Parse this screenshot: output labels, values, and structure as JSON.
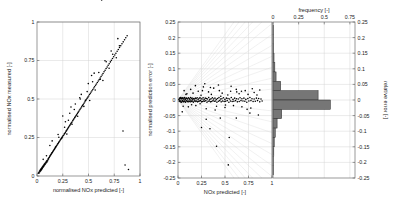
{
  "figure": {
    "title": "",
    "background": "#ffffff",
    "point_color": "#000000",
    "bar_color": "#767676",
    "grid_color": "#d0d0d0"
  },
  "chart_data": [
    {
      "type": "scatter",
      "panel": "left",
      "title": "",
      "xlabel": "normalised NOx predicted [-]",
      "ylabel": "normalised NOx measured [-]",
      "xlim": [
        0,
        1
      ],
      "ylim": [
        0,
        1
      ],
      "xticks": [
        0,
        0.25,
        0.5,
        0.75,
        1
      ],
      "yticks": [
        0,
        0.25,
        0.5,
        0.75,
        1
      ],
      "xticklabels": [
        "0",
        "0.25",
        "0.5",
        "0.75",
        "1"
      ],
      "yticklabels": [
        "0",
        "0.25",
        "0.5",
        "0.75",
        "1"
      ],
      "grid": true,
      "legend": "none",
      "x": [
        0.012,
        0.018,
        0.021,
        0.025,
        0.028,
        0.031,
        0.034,
        0.036,
        0.039,
        0.042,
        0.045,
        0.048,
        0.051,
        0.054,
        0.057,
        0.06,
        0.063,
        0.066,
        0.069,
        0.072,
        0.075,
        0.078,
        0.081,
        0.085,
        0.088,
        0.092,
        0.095,
        0.098,
        0.102,
        0.105,
        0.109,
        0.112,
        0.116,
        0.12,
        0.124,
        0.128,
        0.132,
        0.136,
        0.14,
        0.145,
        0.149,
        0.153,
        0.158,
        0.162,
        0.167,
        0.171,
        0.176,
        0.18,
        0.185,
        0.19,
        0.195,
        0.2,
        0.205,
        0.21,
        0.215,
        0.22,
        0.226,
        0.231,
        0.236,
        0.242,
        0.247,
        0.253,
        0.258,
        0.264,
        0.269,
        0.275,
        0.281,
        0.286,
        0.292,
        0.298,
        0.304,
        0.31,
        0.316,
        0.322,
        0.328,
        0.334,
        0.34,
        0.347,
        0.353,
        0.359,
        0.366,
        0.372,
        0.379,
        0.385,
        0.392,
        0.399,
        0.406,
        0.413,
        0.42,
        0.427,
        0.434,
        0.441,
        0.448,
        0.456,
        0.463,
        0.471,
        0.478,
        0.486,
        0.494,
        0.502,
        0.51,
        0.518,
        0.526,
        0.534,
        0.542,
        0.551,
        0.559,
        0.568,
        0.577,
        0.586,
        0.595,
        0.604,
        0.613,
        0.622,
        0.632,
        0.641,
        0.651,
        0.661,
        0.671,
        0.681,
        0.691,
        0.701,
        0.712,
        0.722,
        0.733,
        0.744,
        0.755,
        0.766,
        0.778,
        0.789,
        0.801,
        0.813,
        0.825,
        0.837,
        0.85,
        0.862,
        0.875,
        0.888,
        0.06,
        0.125,
        0.18,
        0.205,
        0.24,
        0.268,
        0.29,
        0.305,
        0.34,
        0.362,
        0.395,
        0.42,
        0.455,
        0.487,
        0.512,
        0.54,
        0.565,
        0.6,
        0.64,
        0.672,
        0.7,
        0.735,
        0.77,
        0.8,
        0.835,
        0.25,
        0.33,
        0.415,
        0.47,
        0.53,
        0.615,
        0.66,
        0.72,
        0.785,
        0.855,
        0.092,
        0.147,
        0.212,
        0.276,
        0.318,
        0.372,
        0.43,
        0.498,
        0.555,
        0.628
      ],
      "y": [
        0.018,
        0.024,
        0.02,
        0.032,
        0.027,
        0.038,
        0.033,
        0.043,
        0.038,
        0.049,
        0.043,
        0.055,
        0.049,
        0.06,
        0.055,
        0.066,
        0.061,
        0.071,
        0.067,
        0.077,
        0.073,
        0.082,
        0.078,
        0.089,
        0.084,
        0.096,
        0.09,
        0.101,
        0.098,
        0.104,
        0.112,
        0.11,
        0.119,
        0.122,
        0.128,
        0.131,
        0.136,
        0.14,
        0.144,
        0.15,
        0.153,
        0.157,
        0.163,
        0.167,
        0.172,
        0.176,
        0.182,
        0.185,
        0.191,
        0.196,
        0.201,
        0.207,
        0.211,
        0.217,
        0.222,
        0.227,
        0.234,
        0.238,
        0.243,
        0.25,
        0.254,
        0.261,
        0.265,
        0.272,
        0.276,
        0.283,
        0.29,
        0.294,
        0.301,
        0.307,
        0.314,
        0.32,
        0.326,
        0.332,
        0.339,
        0.345,
        0.351,
        0.359,
        0.365,
        0.371,
        0.379,
        0.385,
        0.392,
        0.398,
        0.406,
        0.413,
        0.42,
        0.428,
        0.435,
        0.442,
        0.449,
        0.457,
        0.464,
        0.472,
        0.48,
        0.488,
        0.495,
        0.504,
        0.512,
        0.52,
        0.529,
        0.537,
        0.545,
        0.553,
        0.562,
        0.571,
        0.579,
        0.589,
        0.598,
        0.607,
        0.617,
        0.626,
        0.636,
        0.646,
        0.656,
        0.666,
        0.677,
        0.687,
        0.698,
        0.708,
        0.719,
        0.729,
        0.741,
        0.751,
        0.763,
        0.774,
        0.786,
        0.797,
        0.81,
        0.821,
        0.834,
        0.846,
        0.859,
        0.871,
        0.885,
        0.898,
        0.911,
        0.042,
        0.108,
        0.198,
        0.188,
        0.27,
        0.245,
        0.316,
        0.272,
        0.362,
        0.336,
        0.432,
        0.388,
        0.5,
        0.452,
        0.548,
        0.49,
        0.612,
        0.558,
        0.672,
        0.62,
        0.742,
        0.7,
        0.79,
        0.768,
        0.846,
        0.292,
        0.39,
        0.448,
        0.508,
        0.492,
        0.652,
        0.628,
        0.748,
        0.812,
        0.892,
        0.072,
        0.132,
        0.228,
        0.252,
        0.352,
        0.408,
        0.468,
        0.53,
        0.6,
        0.668
      ],
      "n_points": 190
    },
    {
      "type": "scatter",
      "panel": "middle",
      "title": "",
      "xlabel": "NOx predicted [-]",
      "ylabel": "normalised prediction error [-]",
      "xlim": [
        0,
        1
      ],
      "ylim": [
        -0.25,
        0.25
      ],
      "xticks": [
        0,
        0.25,
        0.5,
        0.75,
        1
      ],
      "yticks": [
        -0.25,
        -0.2,
        -0.15,
        -0.1,
        -0.05,
        0,
        0.05,
        0.1,
        0.15,
        0.2,
        0.25
      ],
      "xticklabels": [
        "0",
        "0.25",
        "0.5",
        "0.75",
        "1"
      ],
      "yticklabels": [
        "-0.25",
        "-0.2",
        "-0.15",
        "-0.1",
        "-0.05",
        "0",
        "0.05",
        "0.1",
        "0.15",
        "0.2",
        "0.25"
      ],
      "grid": true,
      "legend": "none",
      "annotation": "fan of radiating constant-relative-error lines from origin",
      "fan_lines_from": [
        0,
        0
      ],
      "fan_line_count": 24,
      "x": [
        0.01,
        0.014,
        0.017,
        0.02,
        0.023,
        0.026,
        0.029,
        0.032,
        0.035,
        0.038,
        0.041,
        0.044,
        0.047,
        0.05,
        0.053,
        0.056,
        0.059,
        0.062,
        0.065,
        0.068,
        0.071,
        0.074,
        0.077,
        0.08,
        0.084,
        0.087,
        0.09,
        0.094,
        0.097,
        0.101,
        0.104,
        0.108,
        0.111,
        0.115,
        0.119,
        0.122,
        0.126,
        0.13,
        0.134,
        0.138,
        0.142,
        0.146,
        0.15,
        0.154,
        0.158,
        0.163,
        0.167,
        0.171,
        0.176,
        0.18,
        0.185,
        0.19,
        0.194,
        0.199,
        0.204,
        0.209,
        0.214,
        0.219,
        0.224,
        0.229,
        0.234,
        0.24,
        0.245,
        0.25,
        0.256,
        0.261,
        0.267,
        0.273,
        0.278,
        0.284,
        0.29,
        0.296,
        0.302,
        0.308,
        0.314,
        0.32,
        0.327,
        0.333,
        0.339,
        0.346,
        0.352,
        0.359,
        0.366,
        0.372,
        0.379,
        0.386,
        0.393,
        0.4,
        0.407,
        0.414,
        0.422,
        0.429,
        0.436,
        0.444,
        0.452,
        0.459,
        0.467,
        0.475,
        0.483,
        0.491,
        0.499,
        0.507,
        0.515,
        0.524,
        0.532,
        0.541,
        0.549,
        0.558,
        0.567,
        0.576,
        0.585,
        0.594,
        0.603,
        0.612,
        0.622,
        0.631,
        0.641,
        0.651,
        0.66,
        0.67,
        0.68,
        0.691,
        0.701,
        0.711,
        0.722,
        0.732,
        0.743,
        0.754,
        0.765,
        0.776,
        0.787,
        0.799,
        0.81,
        0.822,
        0.834,
        0.846,
        0.858,
        0.87,
        0.883,
        0.895,
        0.03,
        0.045,
        0.065,
        0.085,
        0.11,
        0.135,
        0.16,
        0.19,
        0.215,
        0.245,
        0.27,
        0.3,
        0.325,
        0.355,
        0.38,
        0.41,
        0.44,
        0.47,
        0.5,
        0.53,
        0.56,
        0.59,
        0.62,
        0.65,
        0.68,
        0.715,
        0.745,
        0.775,
        0.81,
        0.84,
        0.87,
        0.055,
        0.095,
        0.145,
        0.185,
        0.235,
        0.285,
        0.345,
        0.395,
        0.455,
        0.505,
        0.565,
        0.625,
        0.675,
        0.735,
        0.79,
        0.855,
        0.26,
        0.3,
        0.34,
        0.43,
        0.545,
        0.62,
        0.41,
        0.535,
        0.765,
        0.25,
        0.45
      ],
      "y": [
        0.002,
        -0.004,
        0.006,
        -0.002,
        0.004,
        -0.006,
        0.008,
        -0.003,
        0.005,
        -0.007,
        0.003,
        -0.004,
        0.006,
        -0.002,
        0.007,
        -0.005,
        0.003,
        -0.006,
        0.004,
        -0.003,
        0.008,
        -0.004,
        0.002,
        -0.007,
        0.005,
        -0.003,
        0.006,
        -0.002,
        0.004,
        -0.005,
        0.003,
        -0.006,
        0.007,
        -0.003,
        0.005,
        -0.004,
        0.002,
        -0.006,
        0.008,
        -0.002,
        0.004,
        -0.005,
        0.006,
        -0.003,
        0.002,
        -0.007,
        0.005,
        -0.004,
        0.003,
        -0.002,
        0.006,
        -0.005,
        0.004,
        -0.003,
        0.007,
        -0.006,
        0.002,
        -0.004,
        0.005,
        -0.003,
        0.008,
        -0.002,
        0.004,
        -0.006,
        0.003,
        -0.005,
        0.007,
        -0.003,
        0.002,
        -0.004,
        0.006,
        -0.002,
        0.005,
        -0.007,
        0.003,
        -0.004,
        0.008,
        -0.003,
        0.002,
        -0.006,
        0.004,
        -0.005,
        0.007,
        -0.002,
        0.003,
        -0.004,
        0.006,
        -0.003,
        0.002,
        -0.007,
        0.005,
        -0.004,
        0.008,
        -0.002,
        0.003,
        -0.006,
        0.004,
        -0.003,
        0.007,
        -0.005,
        0.002,
        -0.004,
        0.006,
        -0.002,
        0.005,
        -0.007,
        0.003,
        -0.003,
        0.008,
        -0.005,
        0.002,
        -0.004,
        0.006,
        -0.002,
        0.004,
        -0.006,
        0.003,
        -0.005,
        0.007,
        -0.002,
        0.004,
        -0.003,
        0.006,
        -0.004,
        0.002,
        -0.007,
        0.005,
        -0.003,
        0.008,
        -0.002,
        0.004,
        -0.005,
        0.003,
        -0.004,
        0.006,
        -0.002,
        0.005,
        -0.006,
        0.003,
        -0.003,
        0.007,
        -0.038,
        0.03,
        0.018,
        -0.022,
        0.034,
        0.022,
        -0.018,
        0.028,
        0.015,
        0.042,
        -0.028,
        0.026,
        0.018,
        0.038,
        -0.02,
        0.03,
        0.022,
        -0.024,
        0.016,
        0.028,
        -0.018,
        0.034,
        0.02,
        -0.022,
        0.03,
        0.018,
        -0.026,
        0.024,
        0.016,
        0.032,
        -0.02,
        0.02,
        -0.015,
        0.046,
        -0.012,
        0.052,
        0.04,
        -0.032,
        0.012,
        -0.016,
        0.044,
        0.026,
        0.028,
        -0.03,
        0.036,
        -0.048,
        0.03,
        -0.062,
        -0.092,
        0.048,
        -0.12,
        -0.058,
        -0.148,
        -0.208,
        -0.042,
        -0.088,
        -0.058,
        0.15
      ],
      "n_points": 200
    },
    {
      "type": "bar",
      "orientation": "horizontal",
      "panel": "right",
      "title": "",
      "xlabel": "frequency [-]",
      "ylabel": "relative error [-]",
      "xlabel_position": "top",
      "ylabel_position": "right",
      "xlim": [
        0,
        0.8
      ],
      "ylim": [
        -0.25,
        0.25
      ],
      "xticks": [
        0,
        0.25,
        0.5,
        0.75
      ],
      "xticklabels": [
        "0",
        "0.25",
        "0.5",
        "0.75"
      ],
      "yticks": [
        -0.25,
        -0.2,
        -0.15,
        -0.1,
        -0.05,
        0,
        0.05,
        0.1,
        0.15,
        0.2,
        0.25
      ],
      "yticklabels": [
        "-0.25",
        "-0.2",
        "-0.15",
        "-0.1",
        "-0.05",
        "0",
        "0.05",
        "0.1",
        "0.15",
        "0.2",
        "0.25"
      ],
      "grid": true,
      "legend": "none",
      "bin_centers": [
        0.225,
        0.195,
        0.165,
        0.135,
        0.105,
        0.075,
        0.045,
        0.015,
        -0.015,
        -0.045,
        -0.075,
        -0.105,
        -0.135,
        -0.165,
        -0.195,
        -0.225
      ],
      "bin_edges": [
        -0.24,
        -0.21,
        -0.18,
        -0.15,
        -0.12,
        -0.09,
        -0.06,
        -0.03,
        0.0,
        0.03,
        0.06,
        0.09,
        0.12,
        0.15,
        0.18,
        0.21,
        0.24
      ],
      "values": [
        0.004,
        0.004,
        0.006,
        0.01,
        0.018,
        0.03,
        0.075,
        0.44,
        0.56,
        0.085,
        0.04,
        0.022,
        0.012,
        0.008,
        0.005,
        0.004
      ],
      "note": "horizontal histogram of relative error; peak bins at -0.05 and 0"
    }
  ],
  "labels": {
    "left_x": "normalised NOx predicted [-]",
    "left_y": "normalised NOx measured [-]",
    "mid_x": "NOx predicted [-]",
    "mid_y": "normalised prediction error [-]",
    "right_x": "frequency [-]",
    "right_y": "relative error [-]"
  }
}
